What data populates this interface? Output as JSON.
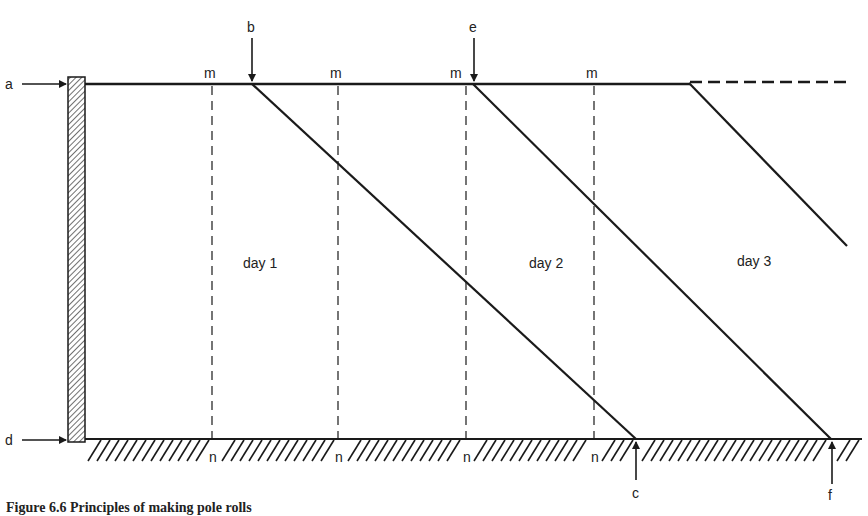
{
  "figure": {
    "caption": "Figure 6.6 Principles of making pole rolls",
    "line_color": "#1a1a1a",
    "background": "#ffffff"
  },
  "labels": {
    "a": "a",
    "b": "b",
    "c": "c",
    "d": "d",
    "e": "e",
    "f": "f",
    "m": [
      "m",
      "m",
      "m",
      "m"
    ],
    "n": [
      "n",
      "n",
      "n",
      "n"
    ]
  },
  "days": [
    "day 1",
    "day 2",
    "day 3"
  ],
  "elements": {
    "left_post": "hatched vertical post",
    "ground": "hatched ground line",
    "top_line": "solid horizontal line continuing as dashed",
    "diagonals": 3,
    "dashed_verticals": 4
  }
}
